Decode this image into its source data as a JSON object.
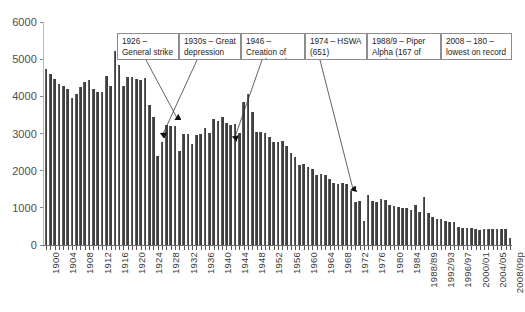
{
  "chart_data": {
    "type": "bar",
    "title": "",
    "subtitle": "",
    "xlabel": "",
    "ylabel": "",
    "ylim": [
      0,
      6000
    ],
    "ytick_values": [
      0,
      1000,
      2000,
      3000,
      4000,
      5000,
      6000
    ],
    "ytick_labels": [
      "0",
      "1000",
      "2000",
      "3000",
      "4000",
      "5000",
      "6000"
    ],
    "grid": false,
    "legend": null,
    "bar_color": "#3f3f3f",
    "categories": [
      "1900",
      "1901",
      "1902",
      "1903",
      "1904",
      "1905",
      "1906",
      "1907",
      "1908",
      "1909",
      "1910",
      "1911",
      "1912",
      "1913",
      "1914",
      "1915",
      "1916",
      "1917",
      "1918",
      "1919",
      "1920",
      "1921",
      "1922",
      "1923",
      "1924",
      "1925",
      "1926",
      "1927",
      "1928",
      "1929",
      "1930",
      "1931",
      "1932",
      "1933",
      "1934",
      "1935",
      "1936",
      "1937",
      "1938",
      "1939",
      "1940",
      "1941",
      "1942",
      "1943",
      "1944",
      "1945",
      "1946",
      "1947",
      "1948",
      "1949",
      "1950",
      "1951",
      "1952",
      "1953",
      "1954",
      "1955",
      "1956",
      "1957",
      "1958",
      "1959",
      "1960",
      "1961",
      "1962",
      "1963",
      "1964",
      "1965",
      "1966",
      "1967",
      "1968",
      "1969",
      "1970",
      "1971",
      "1972",
      "1973",
      "1974",
      "1975",
      "1976",
      "1977",
      "1978",
      "1979",
      "1980",
      "1981",
      "1982",
      "1983",
      "1984",
      "1985/86",
      "1986/87",
      "1987/88",
      "1988/89",
      "1989/90",
      "1990/91",
      "1991/92",
      "1992/93",
      "1993/94",
      "1994/95",
      "1995/96",
      "1996/97",
      "1997/98",
      "1998/99",
      "1999/00",
      "2000/01",
      "2001/02",
      "2002/03",
      "2003/04",
      "2004/05",
      "2005/06",
      "2006/07",
      "2007/08",
      "2008/09p"
    ],
    "xtick_labels_shown": [
      "1900",
      "1904",
      "1908",
      "1912",
      "1916",
      "1920",
      "1924",
      "1928",
      "1932",
      "1936",
      "1940",
      "1944",
      "1948",
      "1952",
      "1956",
      "1960",
      "1964",
      "1968",
      "1972",
      "1976",
      "1980",
      "1984",
      "1988/89",
      "1992/93",
      "1996/97",
      "2000/01",
      "2004/05",
      "2008/09p"
    ],
    "values": [
      4740,
      4610,
      4480,
      4340,
      4290,
      4200,
      3960,
      4060,
      4250,
      4380,
      4430,
      4200,
      4110,
      4120,
      4550,
      4290,
      5220,
      4840,
      4280,
      4530,
      4530,
      4480,
      4450,
      4500,
      3780,
      3440,
      2404,
      2760,
      3230,
      3190,
      3200,
      2520,
      2980,
      3000,
      2710,
      2960,
      3000,
      3160,
      3020,
      3400,
      3330,
      3440,
      3290,
      3240,
      3250,
      3020,
      3850,
      4050,
      3570,
      3030,
      3050,
      3020,
      2910,
      2770,
      2760,
      2800,
      2670,
      2470,
      2370,
      2150,
      2180,
      2110,
      2040,
      1880,
      1920,
      1880,
      1780,
      1670,
      1650,
      1680,
      1640,
      1450,
      1160,
      1190,
      651,
      1340,
      1190,
      1160,
      1230,
      1220,
      1090,
      1060,
      1020,
      1000,
      1000,
      950,
      1080,
      900,
      1290,
      860,
      760,
      700,
      690,
      640,
      620,
      620,
      490,
      460,
      470,
      470,
      420,
      410,
      420,
      420,
      430,
      440,
      440,
      430,
      180
    ],
    "annotations": [
      {
        "id": "anno-1926",
        "text": "1926 – General strike 2404",
        "target_category": "1926",
        "target_value": 2404
      },
      {
        "id": "anno-1930s",
        "text": "1930s – Great depression",
        "target_category": "1932",
        "target_value": 2520
      },
      {
        "id": "anno-1946",
        "text": "1946 – Creation of IIAC (1979)",
        "target_category": "1946",
        "target_value": 3850
      },
      {
        "id": "anno-1974",
        "text": "1974 – HSWA (651)",
        "target_category": "1974",
        "target_value": 651
      },
      {
        "id": "anno-1988",
        "text": "1988/9 – Piper Alpha (167 of 529)",
        "target_category": "1988/89",
        "target_value": 1290
      },
      {
        "id": "anno-2008",
        "text": "2008 – 180 – lowest on record",
        "target_category": "2008/09p",
        "target_value": 180
      }
    ]
  }
}
